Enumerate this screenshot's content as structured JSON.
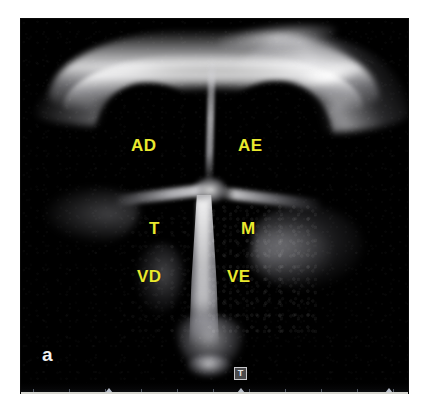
{
  "figure": {
    "panel_label": "a",
    "modality": "echocardiography",
    "view": "four-chamber view",
    "background_color": "#ffffff",
    "image_background_color": "#000000"
  },
  "annotations": {
    "label_color": "#e9e92e",
    "panel_label_color": "#f2f2f2",
    "items": [
      {
        "id": "ad",
        "text": "AD",
        "name": "label-right-atrium",
        "x": 110,
        "y": 118
      },
      {
        "id": "ae",
        "text": "AE",
        "name": "label-left-atrium",
        "x": 217,
        "y": 118
      },
      {
        "id": "t",
        "text": "T",
        "name": "label-tricuspid-valve",
        "x": 128,
        "y": 201
      },
      {
        "id": "m",
        "text": "M",
        "name": "label-mitral-valve",
        "x": 220,
        "y": 201
      },
      {
        "id": "vd",
        "text": "VD",
        "name": "label-right-ventricle",
        "x": 116,
        "y": 249
      },
      {
        "id": "ve",
        "text": "VE",
        "name": "label-left-ventricle",
        "x": 206,
        "y": 249
      }
    ]
  },
  "marker": {
    "transducer_label": "T",
    "name": "transducer-orientation-marker"
  },
  "scale": {
    "tick_count": 11,
    "caret_positions": [
      23,
      51
    ]
  }
}
